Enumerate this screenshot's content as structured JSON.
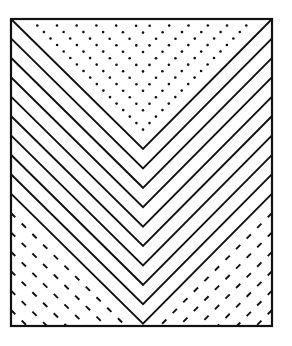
{
  "figure": {
    "width": 292,
    "height": 346,
    "background": "#ffffff",
    "ink": "#111111",
    "frame": {
      "x1": 11,
      "y1": 19,
      "x2": 272,
      "y2": 326,
      "stroke_width": 2.2
    },
    "apex_x": 143,
    "solid_chevrons": {
      "count": 10,
      "first_vertex_y": 149,
      "spacing": 19.4,
      "stroke_width": 1.9
    },
    "dotted_chevrons": {
      "count": 6,
      "spacing": 19.4,
      "dot_radius": 1.3,
      "dot_step": 9
    },
    "dashed_corner_lines": {
      "count": 6,
      "spacing": 19.4,
      "dash": 6,
      "gap": 9,
      "stroke_width": 1.9
    }
  }
}
